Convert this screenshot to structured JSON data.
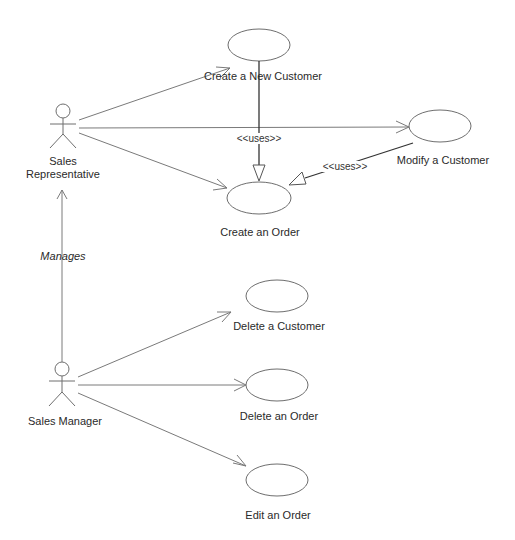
{
  "diagram": {
    "type": "UML use case diagram",
    "actors": [
      {
        "id": "sales_rep",
        "label_line1": "Sales",
        "label_line2": "Representative"
      },
      {
        "id": "sales_manager",
        "label": "Sales Manager"
      }
    ],
    "use_cases": [
      {
        "id": "create_customer",
        "label": "Create a New Customer"
      },
      {
        "id": "modify_customer",
        "label": "Modify a Customer"
      },
      {
        "id": "create_order",
        "label": "Create an Order"
      },
      {
        "id": "delete_customer",
        "label": "Delete a Customer"
      },
      {
        "id": "delete_order",
        "label": "Delete an Order"
      },
      {
        "id": "edit_order",
        "label": "Edit an Order"
      }
    ],
    "relationships": [
      {
        "from": "sales_rep",
        "to": "create_customer",
        "type": "association"
      },
      {
        "from": "sales_rep",
        "to": "modify_customer",
        "type": "association"
      },
      {
        "from": "sales_rep",
        "to": "create_order",
        "type": "association"
      },
      {
        "from": "create_customer",
        "to": "create_order",
        "type": "uses",
        "label": "<<uses>>"
      },
      {
        "from": "modify_customer",
        "to": "create_order",
        "type": "uses",
        "label": "<<uses>>"
      },
      {
        "from": "sales_manager",
        "to": "sales_rep",
        "type": "association",
        "label": "Manages"
      },
      {
        "from": "sales_manager",
        "to": "delete_customer",
        "type": "association"
      },
      {
        "from": "sales_manager",
        "to": "delete_order",
        "type": "association"
      },
      {
        "from": "sales_manager",
        "to": "edit_order",
        "type": "association"
      }
    ],
    "stereotype_label": "<<uses>>",
    "manages_label": "Manages"
  }
}
